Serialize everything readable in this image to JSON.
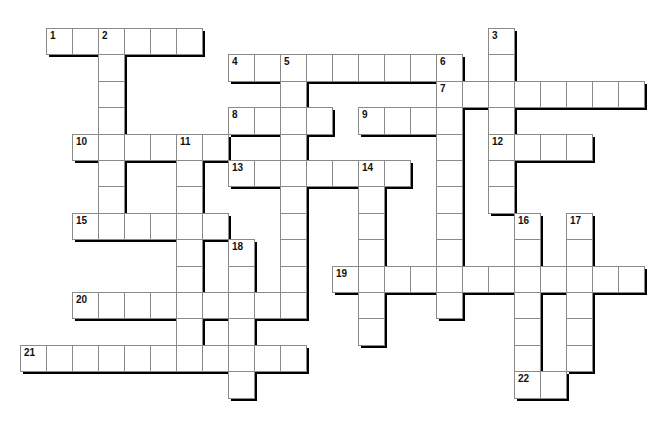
{
  "puzzle": {
    "grid": {
      "origin_x": 20,
      "origin_y": 28,
      "cell_w": 26,
      "cell_h": 26.4,
      "shadow_offset": 3
    },
    "words": [
      {
        "number": "1",
        "direction": "across",
        "row": 0,
        "col": 1,
        "length": 6
      },
      {
        "number": "2",
        "direction": "down",
        "row": 0,
        "col": 3,
        "length": 7
      },
      {
        "number": "3",
        "direction": "down",
        "row": 0,
        "col": 18,
        "length": 7
      },
      {
        "number": "4",
        "direction": "across",
        "row": 1,
        "col": 8,
        "length": 9
      },
      {
        "number": "5",
        "direction": "down",
        "row": 1,
        "col": 10,
        "length": 10
      },
      {
        "number": "6",
        "direction": "down",
        "row": 1,
        "col": 16,
        "length": 10
      },
      {
        "number": "7",
        "direction": "across",
        "row": 2,
        "col": 16,
        "length": 8
      },
      {
        "number": "8",
        "direction": "across",
        "row": 3,
        "col": 8,
        "length": 4
      },
      {
        "number": "9",
        "direction": "across",
        "row": 3,
        "col": 13,
        "length": 4
      },
      {
        "number": "10",
        "direction": "across",
        "row": 4,
        "col": 2,
        "length": 6
      },
      {
        "number": "11",
        "direction": "down",
        "row": 4,
        "col": 6,
        "length": 9
      },
      {
        "number": "12",
        "direction": "across",
        "row": 4,
        "col": 18,
        "length": 4
      },
      {
        "number": "13",
        "direction": "across",
        "row": 5,
        "col": 8,
        "length": 7
      },
      {
        "number": "14",
        "direction": "down",
        "row": 5,
        "col": 13,
        "length": 7
      },
      {
        "number": "15",
        "direction": "across",
        "row": 7,
        "col": 2,
        "length": 6
      },
      {
        "number": "16",
        "direction": "down",
        "row": 7,
        "col": 19,
        "length": 7
      },
      {
        "number": "17",
        "direction": "down",
        "row": 7,
        "col": 21,
        "length": 6
      },
      {
        "number": "18",
        "direction": "down",
        "row": 8,
        "col": 8,
        "length": 6
      },
      {
        "number": "19",
        "direction": "across",
        "row": 9,
        "col": 12,
        "length": 12
      },
      {
        "number": "20",
        "direction": "across",
        "row": 10,
        "col": 2,
        "length": 9
      },
      {
        "number": "21",
        "direction": "across",
        "row": 12,
        "col": 0,
        "length": 11
      },
      {
        "number": "22",
        "direction": "across",
        "row": 13,
        "col": 19,
        "length": 2
      }
    ],
    "colors": {
      "cell_fill": "#ffffff",
      "cell_border": "#8a8a8a",
      "shadow": "#000000",
      "number_text": "#111111"
    }
  }
}
